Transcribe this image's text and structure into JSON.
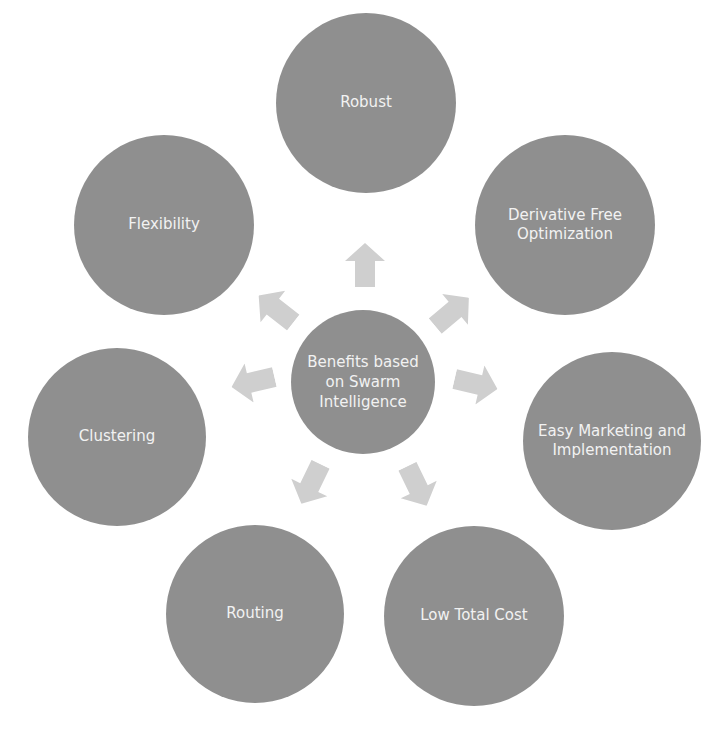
{
  "diagram": {
    "type": "radial-hub",
    "colors": {
      "node_fill": "#8f8f8f",
      "arrow_fill": "#cfcfcf",
      "text": "#f2f2f2",
      "background": "#ffffff"
    },
    "center": {
      "label": "Benefits based on Swarm Intelligence"
    },
    "nodes": [
      {
        "id": "robust",
        "label": "Robust"
      },
      {
        "id": "derivative-free-optimization",
        "label": "Derivative Free Optimization"
      },
      {
        "id": "easy-marketing",
        "label": "Easy Marketing and Implementation"
      },
      {
        "id": "low-total-cost",
        "label": "Low Total Cost"
      },
      {
        "id": "routing",
        "label": "Routing"
      },
      {
        "id": "clustering",
        "label": "Clustering"
      },
      {
        "id": "flexibility",
        "label": "Flexibility"
      }
    ],
    "arrows": [
      {
        "from": "center",
        "to": "robust",
        "icon": "arrow-up-icon"
      },
      {
        "from": "center",
        "to": "derivative-free-optimization",
        "icon": "arrow-up-right-icon"
      },
      {
        "from": "center",
        "to": "easy-marketing",
        "icon": "arrow-right-icon"
      },
      {
        "from": "center",
        "to": "low-total-cost",
        "icon": "arrow-down-right-icon"
      },
      {
        "from": "center",
        "to": "routing",
        "icon": "arrow-down-left-icon"
      },
      {
        "from": "center",
        "to": "clustering",
        "icon": "arrow-left-icon"
      },
      {
        "from": "center",
        "to": "flexibility",
        "icon": "arrow-up-left-icon"
      }
    ]
  }
}
